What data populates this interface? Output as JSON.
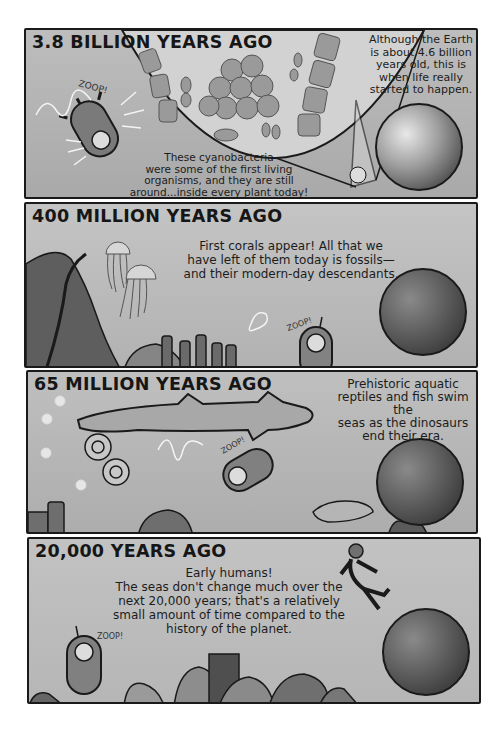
{
  "comic": {
    "panels": [
      {
        "title": "3.8 BILLION YEARS AGO",
        "caption_right": [
          "Although the Earth",
          "is about 4.6 billion",
          "years old, this is",
          "when life really",
          "started to happen."
        ],
        "caption_bottom": [
          "These cyanobacteria",
          "were some of the first living",
          "organisms, and they are still",
          "around...inside every plant today!"
        ],
        "sfx": "ZOOP!",
        "illustration": [
          "submarine",
          "magnified-cyanobacteria",
          "earth-globe"
        ]
      },
      {
        "title": "400 MILLION YEARS AGO",
        "caption": [
          "First corals appear! All that we",
          "have left of them today is fossils—",
          "and their modern-day descendants."
        ],
        "sfx": "ZOOP!",
        "illustration": [
          "crinoid",
          "jellyfish",
          "jellyfish",
          "corals",
          "submarine",
          "earth-globe"
        ]
      },
      {
        "title": "65 MILLION YEARS AGO",
        "caption": [
          "Prehistoric aquatic",
          "reptiles and fish swim the",
          "seas as the dinosaurs",
          "end their era."
        ],
        "sfx": "ZOOP!",
        "illustration": [
          "jellyfish",
          "shark",
          "ammonites",
          "submarine",
          "coelacanth",
          "earth-globe",
          "seafloor"
        ]
      },
      {
        "title": "20,000 YEARS AGO",
        "caption": [
          "Early humans!",
          "The seas don't change much over the",
          "next 20,000 years; that's a relatively",
          "small amount of time compared to the",
          "history of the planet."
        ],
        "sfx": "ZOOP!",
        "illustration": [
          "swimming-human",
          "earth-globe",
          "submarine",
          "coral-reef"
        ]
      }
    ]
  }
}
